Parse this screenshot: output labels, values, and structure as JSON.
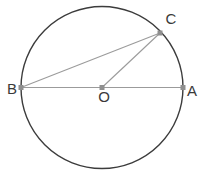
{
  "figure": {
    "background_color": "#ffffff",
    "width": 202,
    "height": 186
  },
  "style": {
    "circle_stroke": "#3c3c3c",
    "circle_stroke_width": 1.4,
    "chord_stroke": "#9b9b9b",
    "chord_stroke_width": 1.1,
    "marker_fill": "#8f8f8f",
    "label_color": "#3a3a3a",
    "label_font_size": 15
  },
  "chart_data": {
    "type": "diagram",
    "subtype": "euclidean-circle",
    "circle": {
      "name": "main-circle",
      "center": {
        "x": 102,
        "y": 87.5
      },
      "radius": 81,
      "filled": false
    },
    "points": [
      {
        "id": "B",
        "label": "B",
        "x": 21,
        "y": 87.5,
        "label_x": 12,
        "label_y": 90,
        "on_circle": true,
        "marker": true
      },
      {
        "id": "O",
        "label": "O",
        "x": 102,
        "y": 87.5,
        "label_x": 104,
        "label_y": 98,
        "on_circle": false,
        "marker": true
      },
      {
        "id": "A",
        "label": "A",
        "x": 183,
        "y": 87.5,
        "label_x": 192,
        "label_y": 92,
        "on_circle": true,
        "marker": true
      },
      {
        "id": "C",
        "label": "C",
        "x": 160,
        "y": 33,
        "label_x": 171,
        "label_y": 20,
        "on_circle": true,
        "marker": true
      }
    ],
    "segments": [
      {
        "name": "diameter-BA",
        "from": "B",
        "to": "A",
        "kind": "diameter"
      },
      {
        "name": "chord-BC",
        "from": "B",
        "to": "C",
        "kind": "chord"
      },
      {
        "name": "radius-OC",
        "from": "O",
        "to": "C",
        "kind": "radius"
      }
    ],
    "labels": [
      "B",
      "O",
      "A",
      "C"
    ]
  }
}
